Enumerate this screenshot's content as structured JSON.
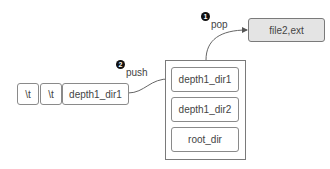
{
  "input_sequence": {
    "tokens": [
      "\\t",
      "\\t",
      "depth1_dir1"
    ]
  },
  "stack": {
    "items": [
      "depth1_dir1",
      "depth1_dir2",
      "root_dir"
    ]
  },
  "output": {
    "label": "file2,ext"
  },
  "steps": [
    {
      "number": "1",
      "label": "pop"
    },
    {
      "number": "2",
      "label": "push"
    }
  ]
}
